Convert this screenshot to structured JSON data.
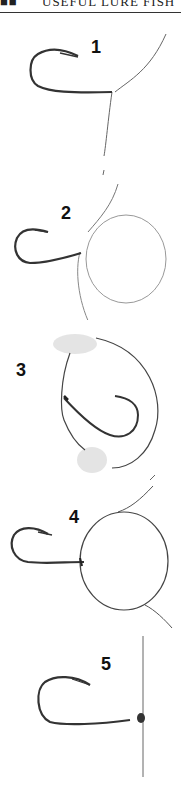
{
  "header": {
    "mark": "■■",
    "text": "USEFUL LURE FISH"
  },
  "figure": {
    "steps": [
      {
        "number": "1",
        "description": "Hook with line passed through eye"
      },
      {
        "number": "2",
        "description": "Line formed into a loop beside hook shank"
      },
      {
        "number": "3",
        "description": "Loop wrapped around hook held between fingers"
      },
      {
        "number": "4",
        "description": "Large loop around hook eye"
      },
      {
        "number": "5",
        "description": "Knot tightened against hook eye"
      }
    ]
  },
  "colors": {
    "line": "#555555",
    "hook": "#333333",
    "finger": "#cccccc"
  }
}
